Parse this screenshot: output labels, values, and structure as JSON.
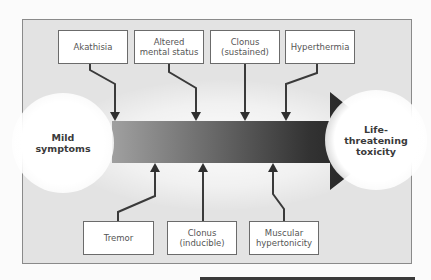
{
  "diagram": {
    "type": "flow-progression",
    "start_node": {
      "label": "Mild\nsymptoms"
    },
    "end_node": {
      "label": "Life-\nthreatening\ntoxicity"
    },
    "top_boxes": [
      {
        "label": "Akathisia"
      },
      {
        "label": "Altered\nmental status"
      },
      {
        "label": "Clonus\n(sustained)"
      },
      {
        "label": "Hyperthermia"
      }
    ],
    "bottom_boxes": [
      {
        "label": "Tremor"
      },
      {
        "label": "Clonus\n(inducible)"
      },
      {
        "label": "Muscular\nhypertonicity"
      }
    ],
    "colors": {
      "panel_background": "#e3e3e3",
      "box_border": "#6b6b6b",
      "arrow_start": "#9a9a9a",
      "arrow_end": "#1e1e1e",
      "connector": "#3a3a3a"
    }
  }
}
